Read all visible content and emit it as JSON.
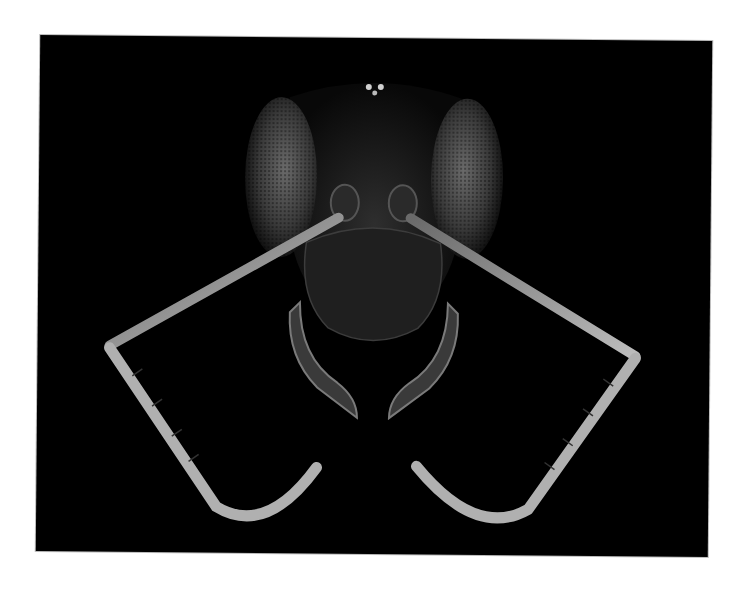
{
  "image": {
    "subject": "macro photograph of an ant head, frontal view",
    "background_color": "#000000",
    "page_background": "#ffffff",
    "highlight_color": "#d8d8d8"
  }
}
